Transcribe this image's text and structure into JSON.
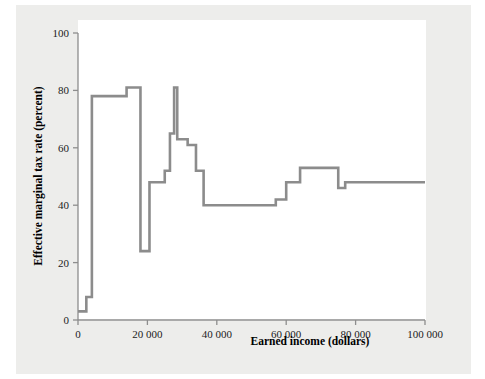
{
  "chart_data": {
    "type": "line",
    "title": "",
    "subtitle": "",
    "xlabel": "Earned income (dollars)",
    "ylabel": "Effective marginal tax rate (percent)",
    "xlim": [
      0,
      100000
    ],
    "ylim": [
      0,
      100
    ],
    "xticks": [
      0,
      20000,
      40000,
      60000,
      80000,
      100000
    ],
    "xticklabels": [
      "0",
      "20 000",
      "40 000",
      "60 000",
      "80 000",
      "100 000"
    ],
    "yticks": [
      0,
      20,
      40,
      60,
      80,
      100
    ],
    "yticklabels": [
      "0",
      "20",
      "40",
      "60",
      "80",
      "100"
    ],
    "grid": false,
    "legend": false,
    "legend_position": "none",
    "line_color": "#8c8c8c",
    "drawstyle": "steps-post",
    "series": [
      {
        "name": "Effective marginal tax rate",
        "x": [
          0,
          2400,
          4000,
          14000,
          18000,
          20600,
          25000,
          26500,
          27700,
          28600,
          31600,
          34000,
          36200,
          57000,
          60000,
          64000,
          75000,
          77000,
          100000
        ],
        "y": [
          3,
          8,
          78,
          81,
          24,
          48,
          52,
          65,
          81,
          63,
          61,
          52,
          40,
          42,
          48,
          53,
          46,
          48,
          48
        ]
      }
    ],
    "annotations": []
  },
  "axis": {
    "x_title": "Earned income (dollars)",
    "y_title": "Effective marginal tax rate (percent)"
  },
  "colors": {
    "page_background": "#ffffff",
    "panel_background": "#ededeb",
    "plot_background": "#ffffff",
    "axis": "#8d8d8d",
    "line": "#8c8c8c",
    "text": "#1b1b1b"
  }
}
